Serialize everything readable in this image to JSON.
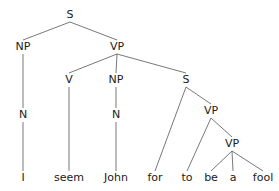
{
  "diagram": {
    "type": "syntax-tree",
    "nodes": [
      {
        "id": "s",
        "label": "S",
        "x": 70,
        "y": 15
      },
      {
        "id": "np1",
        "label": "NP",
        "x": 23,
        "y": 47
      },
      {
        "id": "vp1",
        "label": "VP",
        "x": 117,
        "y": 47
      },
      {
        "id": "n1",
        "label": "N",
        "x": 23,
        "y": 115
      },
      {
        "id": "v",
        "label": "V",
        "x": 69,
        "y": 80
      },
      {
        "id": "np2",
        "label": "NP",
        "x": 116,
        "y": 80
      },
      {
        "id": "s2",
        "label": "S",
        "x": 186,
        "y": 80
      },
      {
        "id": "n2",
        "label": "N",
        "x": 116,
        "y": 115
      },
      {
        "id": "vp2",
        "label": "VP",
        "x": 211,
        "y": 111
      },
      {
        "id": "vp3",
        "label": "VP",
        "x": 232,
        "y": 144
      },
      {
        "id": "w_i",
        "label": "I",
        "x": 23,
        "y": 178
      },
      {
        "id": "w_seem",
        "label": "seem",
        "x": 69,
        "y": 178
      },
      {
        "id": "w_john",
        "label": "John",
        "x": 116,
        "y": 178
      },
      {
        "id": "w_for",
        "label": "for",
        "x": 155,
        "y": 178
      },
      {
        "id": "w_to",
        "label": "to",
        "x": 187,
        "y": 178
      },
      {
        "id": "w_be",
        "label": "be",
        "x": 211,
        "y": 178
      },
      {
        "id": "w_a",
        "label": "a",
        "x": 233,
        "y": 178
      },
      {
        "id": "w_fool",
        "label": "fool",
        "x": 263,
        "y": 178
      }
    ],
    "edges": [
      [
        "s",
        "np1"
      ],
      [
        "s",
        "vp1"
      ],
      [
        "np1",
        "n1"
      ],
      [
        "n1",
        "w_i"
      ],
      [
        "vp1",
        "v"
      ],
      [
        "vp1",
        "np2"
      ],
      [
        "vp1",
        "s2"
      ],
      [
        "v",
        "w_seem"
      ],
      [
        "np2",
        "n2"
      ],
      [
        "n2",
        "w_john"
      ],
      [
        "s2",
        "w_for"
      ],
      [
        "s2",
        "vp2"
      ],
      [
        "vp2",
        "w_to"
      ],
      [
        "vp2",
        "vp3"
      ],
      [
        "vp3",
        "w_be"
      ],
      [
        "vp3",
        "w_a"
      ],
      [
        "vp3",
        "w_fool"
      ]
    ]
  }
}
